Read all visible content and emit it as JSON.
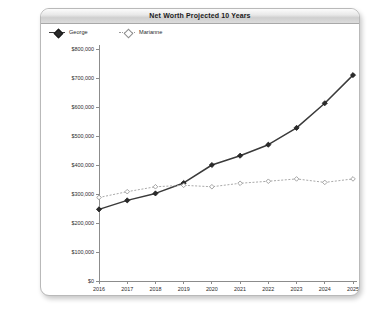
{
  "window": {
    "title": "Net Worth Projected 10 Years"
  },
  "legend": {
    "position": "top-left",
    "entries": [
      {
        "label": "George",
        "marker": "filled-diamond-icon",
        "color": "#3a3a3a"
      },
      {
        "label": "Marianne",
        "marker": "open-diamond-icon",
        "color": "#a9a9a9"
      }
    ]
  },
  "chart_data": {
    "type": "line",
    "title": "Net Worth Projected 10 Years",
    "xlabel": "",
    "ylabel": "",
    "categories": [
      "2016",
      "2017",
      "2018",
      "2019",
      "2020",
      "2021",
      "2022",
      "2023",
      "2024",
      "2025"
    ],
    "x": [
      2016,
      2017,
      2018,
      2019,
      2020,
      2021,
      2022,
      2023,
      2024,
      2025
    ],
    "ylim": [
      0,
      800000
    ],
    "ytick_values": [
      0,
      100000,
      200000,
      300000,
      400000,
      500000,
      600000,
      700000,
      800000
    ],
    "ytick_labels": [
      "$0",
      "$100,000",
      "$200,000",
      "$300,000",
      "$400,000",
      "$500,000",
      "$600,000",
      "$700,000",
      "$800,000"
    ],
    "grid": false,
    "legend_position": "top-left",
    "series": [
      {
        "name": "George",
        "color": "#3a3a3a",
        "style": "solid",
        "marker": "filled-diamond",
        "values": [
          247000,
          278000,
          302000,
          338000,
          400000,
          432000,
          470000,
          528000,
          613000,
          710000
        ]
      },
      {
        "name": "Marianne",
        "color": "#a9a9a9",
        "style": "dotted",
        "marker": "open-diamond",
        "values": [
          288000,
          308000,
          325000,
          330000,
          325000,
          337000,
          344000,
          352000,
          340000,
          352000
        ]
      }
    ]
  }
}
